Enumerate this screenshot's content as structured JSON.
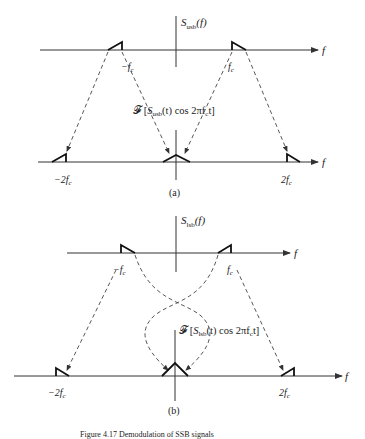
{
  "panel_a": {
    "top_ylabel_main": "S",
    "top_ylabel_sub": "usb",
    "top_ylabel_arg": "(f)",
    "axis_var": "f",
    "neg_fc": "−f",
    "pos_fc": "f",
    "fc_sub": "c",
    "transform_prefix": "𝓕 [",
    "transform_s": "S",
    "transform_sub": "usb",
    "transform_rest": "(t) cos 2πf",
    "transform_c": "c",
    "transform_end": "t]",
    "neg_2fc": "−2f",
    "pos_2fc": "2f",
    "caption": "(a)"
  },
  "panel_b": {
    "top_ylabel_main": "S",
    "top_ylabel_sub": "lsb",
    "top_ylabel_arg": "(f)",
    "axis_var": "f",
    "neg_fc": "−f",
    "pos_fc": "f",
    "fc_sub": "c",
    "transform_prefix": "𝓕 [",
    "transform_s": "S",
    "transform_sub": "lsb",
    "transform_rest": "(t) cos 2πf",
    "transform_c": "c",
    "transform_end": "t]",
    "neg_2fc": "−2f",
    "pos_2fc": "2f",
    "caption": "(b)"
  },
  "figure_caption": "Figure 4.17  Demodulation of SSB signals"
}
